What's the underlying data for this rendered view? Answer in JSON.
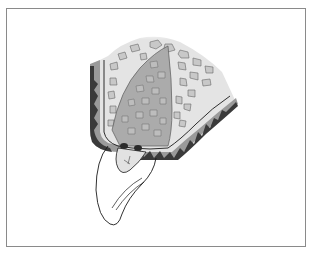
{
  "figure": {
    "type": "anatomical-illustration",
    "colors": {
      "frame_border": "#8a8a8a",
      "cortical_dark": "#3a3a3a",
      "cortical_mid": "#9a9a9a",
      "cancellous_light": "#e4e4e4",
      "graft_fill": "#a8a8a8",
      "trabecula_cell": "#c8c8c8",
      "outline": "#1a1a1a",
      "tooth_fill": "#ffffff",
      "crown_fill": "#e2e2e2"
    }
  }
}
